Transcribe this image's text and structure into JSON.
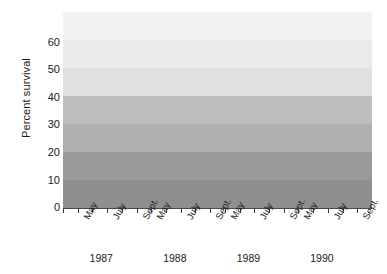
{
  "chart_data": {
    "type": "line",
    "title": "",
    "xlabel": "",
    "ylabel": "Percent survival",
    "ylim": [
      0,
      70
    ],
    "yticks": [
      0,
      10,
      20,
      30,
      40,
      50,
      60
    ],
    "grid": false,
    "legend": null,
    "x_tick_labels": [
      "May",
      "July",
      "Sept."
    ],
    "year_groups": [
      "1987",
      "1988",
      "1989",
      "1990"
    ],
    "series": [
      {
        "name": "Percent survival",
        "color": "#1a1a1a",
        "marker": "circle",
        "points": [
          {
            "year": "1987",
            "month": "May",
            "slot": 1,
            "value": 5.5
          },
          {
            "year": "1987",
            "month": "June",
            "slot": 2,
            "value": 31.5
          },
          {
            "year": "1987",
            "month": "July",
            "slot": 3,
            "value": 22.0
          },
          {
            "year": "1987",
            "month": "Aug.",
            "slot": 4,
            "value": 19.0
          },
          {
            "year": "1988",
            "month": "May",
            "slot": 6,
            "value": 11.5
          },
          {
            "year": "1988",
            "month": "June",
            "slot": 7,
            "value": 37.0
          },
          {
            "year": "1988",
            "month": "July",
            "slot": 8,
            "value": 43.0
          },
          {
            "year": "1988",
            "month": "Aug.",
            "slot": 9,
            "value": 29.0
          },
          {
            "year": "1989",
            "month": "May",
            "slot": 11,
            "value": 17.0
          },
          {
            "year": "1989",
            "month": "June",
            "slot": 12,
            "value": 45.5
          },
          {
            "year": "1989",
            "month": "July",
            "slot": 13,
            "value": 55.0
          },
          {
            "year": "1989",
            "month": "Aug.",
            "slot": 14,
            "value": 45.0
          },
          {
            "year": "1990",
            "month": "May",
            "slot": 16,
            "value": 16.0
          },
          {
            "year": "1990",
            "month": "June",
            "slot": 17,
            "value": 44.0
          },
          {
            "year": "1990",
            "month": "July",
            "slot": 18,
            "value": 60.5
          },
          {
            "year": "1990",
            "month": "Aug.",
            "slot": 19,
            "value": 55.0
          }
        ]
      }
    ],
    "background_bands": [
      {
        "from": 60,
        "to": 70,
        "color": "#f2f2f2"
      },
      {
        "from": 50,
        "to": 60,
        "color": "#eaeaea"
      },
      {
        "from": 40,
        "to": 50,
        "color": "#e0e0e0"
      },
      {
        "from": 30,
        "to": 40,
        "color": "#bdbdbd"
      },
      {
        "from": 20,
        "to": 30,
        "color": "#b0b0b0"
      },
      {
        "from": 10,
        "to": 20,
        "color": "#9a9a9a"
      },
      {
        "from": 0,
        "to": 10,
        "color": "#8f8f8f"
      }
    ]
  },
  "axis": {
    "ylabel": "Percent survival",
    "yticks": [
      "60",
      "50",
      "40",
      "30",
      "20",
      "10",
      "0"
    ]
  },
  "xaxis": {
    "groups": [
      {
        "year": "1987",
        "labels": [
          "May",
          "July",
          "Sept."
        ]
      },
      {
        "year": "1988",
        "labels": [
          "May",
          "July",
          "Sept."
        ]
      },
      {
        "year": "1989",
        "labels": [
          "May",
          "July",
          "Sept."
        ]
      },
      {
        "year": "1990",
        "labels": [
          "May",
          "July",
          "Sept."
        ]
      }
    ]
  }
}
